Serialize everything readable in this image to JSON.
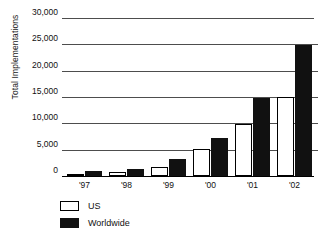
{
  "chart_data": {
    "type": "bar",
    "title": "",
    "subtitle": "",
    "xlabel": "",
    "ylabel": "Total Implementations",
    "categories": [
      "'97",
      "'98",
      "'99",
      "'00",
      "'01",
      "'02"
    ],
    "series": [
      {
        "name": "US",
        "values": [
          300,
          700,
          1800,
          5200,
          9800,
          15000
        ]
      },
      {
        "name": "Worldwide",
        "values": [
          900,
          1400,
          3200,
          7200,
          14800,
          24800
        ]
      }
    ],
    "ylim": [
      0,
      30000
    ],
    "ytick_values": [
      0,
      5000,
      10000,
      15000,
      20000,
      25000,
      30000
    ],
    "ytick_labels": [
      "0",
      "5,000",
      "10,000",
      "15,000",
      "20,000",
      "25,000",
      "30,000"
    ],
    "grid": true,
    "grid_axis": "y",
    "legend_position": "bottom-left",
    "colors": {
      "us": "#ffffff",
      "us_border": "#000000",
      "worldwide": "#111111",
      "gridline": "#4d4d4d",
      "axis": "#000000",
      "text": "#111111"
    }
  },
  "legend": {
    "items": [
      {
        "label": "US",
        "swatch": "white-square-outline"
      },
      {
        "label": "Worldwide",
        "swatch": "black-square-filled"
      }
    ]
  }
}
